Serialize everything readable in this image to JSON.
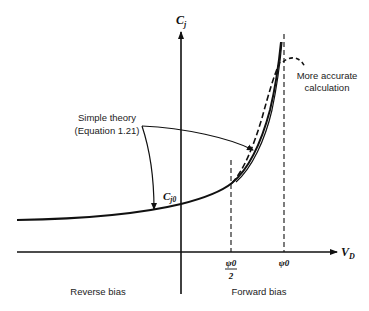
{
  "figure": {
    "y_axis_label": "C",
    "y_axis_sub": "j",
    "x_axis_label": "V",
    "x_axis_sub": "D",
    "cj0_label": "C",
    "cj0_sub": "j0",
    "psi_half_num": "ψ0",
    "psi_half_den": "2",
    "psi0_label": "ψ0",
    "annotations": {
      "simple_theory_line1": "Simple theory",
      "simple_theory_line2": "(Equation 1.21)",
      "accurate_line1": "More accurate",
      "accurate_line2": "calculation"
    },
    "regions": {
      "reverse": "Reverse bias",
      "forward": "Forward bias"
    },
    "colors": {
      "stroke": "#111111",
      "background": "#ffffff"
    }
  }
}
